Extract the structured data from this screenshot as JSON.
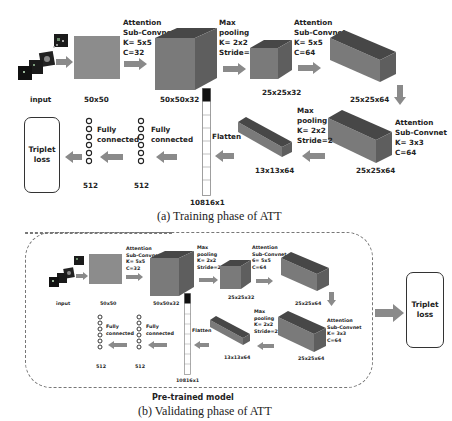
{
  "figure": {
    "panels": [
      {
        "id": "training",
        "caption": "(a) Training phase of ATT",
        "stages": {
          "input": {
            "label": "input"
          },
          "map50": {
            "label": "50x50"
          },
          "conv1": {
            "header": "Attention\nSub-Convnet\nK= 5x5\nC=32",
            "label": "50x50x32"
          },
          "pool1": {
            "header": "Max\npooling\nK= 2x2\nStride=2",
            "label": "25x25x32"
          },
          "conv2": {
            "header": "Attention\nSub-Convnet\nK= 5x5\nC=64",
            "label": "25x25x64"
          },
          "conv3": {
            "header": "Attention\nSub-Convnet\nK= 3x3\nC=64",
            "label": "25x25x64"
          },
          "pool2": {
            "header": "Max\npooling\nK= 2x2\nStride=2",
            "label": "13x13x64"
          },
          "flatten": {
            "header": "Flatten",
            "label": "10816x1"
          },
          "fc1": {
            "header": "Fully\nconnected",
            "label": "512"
          },
          "fc2": {
            "header": "Fully\nconnected",
            "label": "512"
          },
          "loss": {
            "label": "Triplet\nloss"
          }
        }
      },
      {
        "id": "validating",
        "caption": "(b) Validating phase of ATT",
        "group_label": "Pre-trained model",
        "stages": {
          "input": {
            "label": "input"
          },
          "map50": {
            "label": "50x50"
          },
          "conv1": {
            "header": "Attention\nSub-Convnet\nK= 5x5\nC=32",
            "label": "50x50x32"
          },
          "pool1": {
            "header": "Max\npooling\nK= 2x2\nStride=2",
            "label": "25x25x32"
          },
          "conv2": {
            "header": "Attention\nSub-Convnet\n6= 5x5\nC=64",
            "label": "25x25x64"
          },
          "conv3": {
            "header": "Attention\nSub-Convnet\nK= 3x3\nC=64",
            "label": "25x25x64"
          },
          "pool2": {
            "header": "Max\npooling\nK= 2x2\nStride=2",
            "label": "13x13x64"
          },
          "flatten": {
            "header": "Flatten",
            "label": "10816x1"
          },
          "fc1": {
            "header": "Fully\nconnected",
            "label": "512"
          },
          "fc2": {
            "header": "Fully\nconnected",
            "label": "512"
          },
          "loss": {
            "label": "Triplet\nloss"
          }
        }
      }
    ],
    "colors": {
      "block_front": "#7a7a7a",
      "block_side": "#5e5e5e",
      "block_top": "#474747",
      "arrow": "#8a8a8a",
      "map": "#8c8c8c"
    }
  }
}
